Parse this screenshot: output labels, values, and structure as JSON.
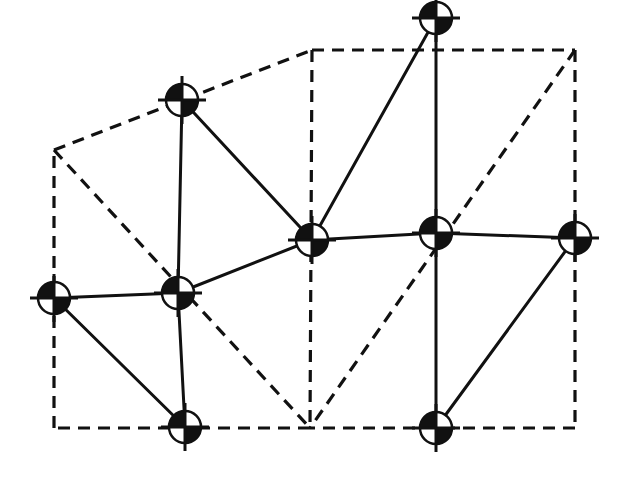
{
  "diagram": {
    "title": "",
    "background": "#ffffff",
    "stroke_color": "#111111",
    "marker_style": "circle-crosshair-quartered",
    "marker_radius": 16,
    "crosshair_length": 24,
    "dashed_vertices": [
      {
        "id": "A",
        "x": 54,
        "y": 150
      },
      {
        "id": "B",
        "x": 312,
        "y": 50
      },
      {
        "id": "C",
        "x": 575,
        "y": 50
      },
      {
        "id": "D",
        "x": 575,
        "y": 428
      },
      {
        "id": "E",
        "x": 310,
        "y": 428
      },
      {
        "id": "F",
        "x": 54,
        "y": 428
      }
    ],
    "dashed_edges": [
      [
        "A",
        "B"
      ],
      [
        "B",
        "C"
      ],
      [
        "C",
        "D"
      ],
      [
        "D",
        "E"
      ],
      [
        "E",
        "F"
      ],
      [
        "F",
        "A"
      ],
      [
        "A",
        "E"
      ],
      [
        "B",
        "E"
      ],
      [
        "C",
        "E"
      ]
    ],
    "nodes": [
      {
        "id": "N1",
        "x": 182,
        "y": 100
      },
      {
        "id": "N2",
        "x": 436,
        "y": 18
      },
      {
        "id": "N3",
        "x": 54,
        "y": 298
      },
      {
        "id": "N4",
        "x": 178,
        "y": 293
      },
      {
        "id": "N5",
        "x": 312,
        "y": 240
      },
      {
        "id": "N6",
        "x": 436,
        "y": 233
      },
      {
        "id": "N7",
        "x": 575,
        "y": 238
      },
      {
        "id": "N8",
        "x": 185,
        "y": 427
      },
      {
        "id": "N9",
        "x": 436,
        "y": 428
      }
    ],
    "solid_edges": [
      [
        "N1",
        "N4"
      ],
      [
        "N1",
        "N5"
      ],
      [
        "N2",
        "N5"
      ],
      [
        "N2",
        "N6"
      ],
      [
        "N3",
        "N4"
      ],
      [
        "N3",
        "N8"
      ],
      [
        "N4",
        "N5"
      ],
      [
        "N4",
        "N8"
      ],
      [
        "N5",
        "N6"
      ],
      [
        "N6",
        "N7"
      ],
      [
        "N6",
        "N9"
      ],
      [
        "N7",
        "N9"
      ]
    ]
  }
}
